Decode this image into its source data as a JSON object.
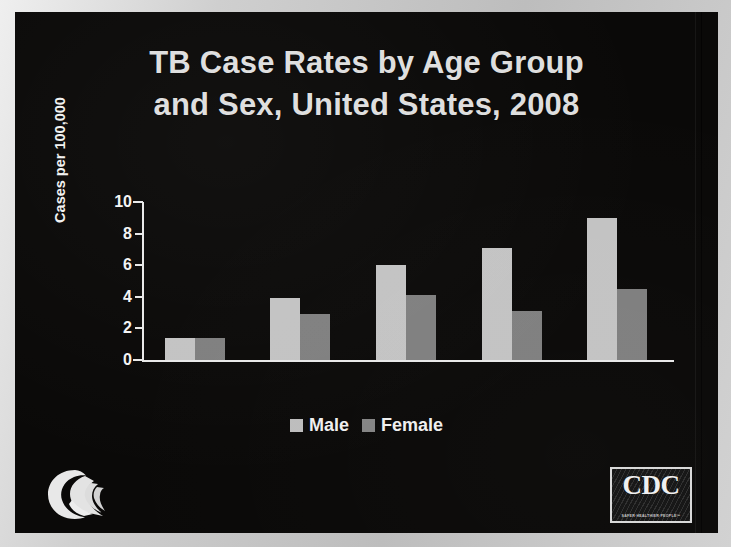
{
  "slide": {
    "title_line1": "TB Case Rates by Age Group",
    "title_line2": "and Sex, United States, 2008",
    "background_color": "#0a0908",
    "text_color": "#dedede"
  },
  "legend": {
    "items": [
      {
        "label": "Male",
        "color": "#bdbdbd",
        "swatch_icon": "square-swatch-icon"
      },
      {
        "label": "Female",
        "color": "#848484",
        "swatch_icon": "square-swatch-icon"
      }
    ]
  },
  "logos": {
    "hhs": {
      "name": "hhs-eagle-logo-icon",
      "alt": "U.S. Department of Health and Human Services"
    },
    "cdc": {
      "name": "cdc-logo-icon",
      "text": "CDC",
      "tagline": "SAFER·HEALTHIER·PEOPLE™"
    }
  },
  "chart_data": {
    "type": "bar",
    "title": "TB Case Rates by Age Group and Sex, United States, 2008",
    "subtitle": "",
    "xlabel": "",
    "ylabel": "Cases per 100,000",
    "categories": [
      "<15 yrs",
      "15–24 yrs",
      "25–44 yrs",
      "45–64 yrs",
      "≥65 yrs"
    ],
    "series": [
      {
        "name": "Male",
        "color": "#c3c3c3",
        "values": [
          1.4,
          3.9,
          6.0,
          7.1,
          9.0
        ]
      },
      {
        "name": "Female",
        "color": "#7f7f7f",
        "values": [
          1.4,
          2.9,
          4.1,
          3.1,
          4.5
        ]
      }
    ],
    "ylim": [
      0,
      10
    ],
    "yticks": [
      0,
      2,
      4,
      6,
      8,
      10
    ],
    "ytick_labels": [
      "0",
      "2",
      "4",
      "6",
      "8",
      "10"
    ],
    "grid": false,
    "legend_position": "bottom-center"
  }
}
